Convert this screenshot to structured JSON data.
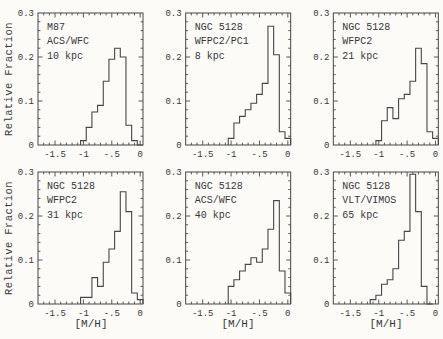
{
  "figure": {
    "xlabel": "[M/H]",
    "ylabel": "Relative Fraction",
    "bg_color": "#fcfbf8",
    "line_color": "#474747",
    "text_color": "#383838",
    "grid": "off",
    "layout": "2 rows x 3 columns of histogram panels",
    "xlim": [
      -1.8,
      0.05
    ],
    "ylim": [
      0,
      0.3
    ],
    "x_tick_values": [
      -1.5,
      -1,
      -0.5,
      0
    ],
    "x_tick_labels": [
      "-1.5",
      "-1",
      "-.5",
      "0"
    ],
    "x_minor_step": 0.1,
    "y_tick_values": [
      0,
      0.1,
      0.2,
      0.3
    ],
    "y_tick_labels": [
      "0",
      "0.1",
      "0.2",
      "0.3"
    ],
    "y_minor_step": 0.02
  },
  "chart_data": [
    {
      "type": "histogram",
      "labels": [
        "M87",
        "ACS/WFC",
        "10 kpc"
      ],
      "xlabel": "[M/H]",
      "ylabel": "Relative Fraction",
      "xlim": [
        -1.8,
        0.05
      ],
      "ylim": [
        0,
        0.3
      ],
      "bin_start": -1.05,
      "bin_width": 0.1,
      "values": [
        0.01,
        0.04,
        0.075,
        0.09,
        0.145,
        0.195,
        0.22,
        0.2,
        0.045,
        0.01,
        0
      ]
    },
    {
      "type": "histogram",
      "labels": [
        "NGC 5128",
        "WFPC2/PC1",
        "8 kpc"
      ],
      "xlabel": "[M/H]",
      "ylabel": "Relative Fraction",
      "xlim": [
        -1.8,
        0.05
      ],
      "ylim": [
        0,
        0.3
      ],
      "bin_start": -1.05,
      "bin_width": 0.1,
      "values": [
        0.015,
        0.05,
        0.065,
        0.08,
        0.095,
        0.115,
        0.14,
        0.27,
        0.205,
        0.03,
        0.015
      ]
    },
    {
      "type": "histogram",
      "labels": [
        "NGC 5128",
        "WFPC2",
        "21 kpc"
      ],
      "xlabel": "[M/H]",
      "ylabel": "Relative Fraction",
      "xlim": [
        -1.8,
        0.05
      ],
      "ylim": [
        0,
        0.3
      ],
      "bin_start": -1.05,
      "bin_width": 0.1,
      "values": [
        0.01,
        0.055,
        0.085,
        0.06,
        0.105,
        0.115,
        0.145,
        0.22,
        0.185,
        0.03,
        0.015
      ]
    },
    {
      "type": "histogram",
      "labels": [
        "NGC 5128",
        "WFPC2",
        "31 kpc"
      ],
      "xlabel": "[M/H]",
      "ylabel": "Relative Fraction",
      "xlim": [
        -1.8,
        0.05
      ],
      "ylim": [
        0,
        0.3
      ],
      "bin_start": -1.05,
      "bin_width": 0.1,
      "values": [
        0.015,
        0.015,
        0.06,
        0.04,
        0.095,
        0.125,
        0.165,
        0.255,
        0.21,
        0.025,
        0.01
      ]
    },
    {
      "type": "histogram",
      "labels": [
        "NGC 5128",
        "ACS/WFC",
        "40 kpc"
      ],
      "xlabel": "[M/H]",
      "ylabel": "Relative Fraction",
      "xlim": [
        -1.8,
        0.05
      ],
      "ylim": [
        0,
        0.3
      ],
      "bin_start": -1.05,
      "bin_width": 0.1,
      "values": [
        0.04,
        0.055,
        0.075,
        0.09,
        0.105,
        0.095,
        0.125,
        0.17,
        0.235,
        0.075,
        0.025
      ]
    },
    {
      "type": "histogram",
      "labels": [
        "NGC 5128",
        "VLT/VIMOS",
        "65 kpc"
      ],
      "xlabel": "[M/H]",
      "ylabel": "Relative Fraction",
      "xlim": [
        -1.8,
        0.05
      ],
      "ylim": [
        0,
        0.3
      ],
      "bin_start": -1.15,
      "bin_width": 0.1,
      "values": [
        0.01,
        0.02,
        0.045,
        0.055,
        0.08,
        0.145,
        0.165,
        0.295,
        0.21,
        0.04,
        0
      ]
    }
  ]
}
